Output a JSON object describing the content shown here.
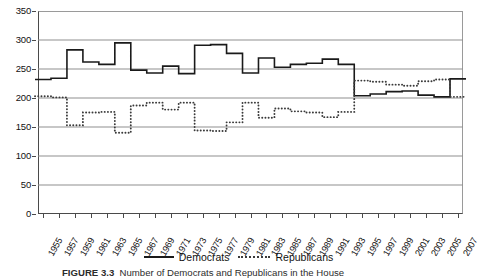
{
  "chart_data": {
    "type": "line",
    "title": "",
    "xlabel": "",
    "ylabel": "",
    "ylim": [
      0,
      350
    ],
    "ytick_step": 50,
    "yticks": [
      0,
      50,
      100,
      150,
      200,
      250,
      300,
      350
    ],
    "grid": "horizontal",
    "legend_position": "bottom-center",
    "x": [
      1955,
      1957,
      1959,
      1961,
      1963,
      1965,
      1967,
      1969,
      1971,
      1973,
      1975,
      1977,
      1979,
      1981,
      1983,
      1985,
      1987,
      1989,
      1991,
      1993,
      1995,
      1997,
      1999,
      2001,
      2003,
      2005,
      2007
    ],
    "categories": [
      "1955",
      "1957",
      "1959",
      "1961",
      "1963",
      "1965",
      "1967",
      "1969",
      "1971",
      "1973",
      "1975",
      "1977",
      "1979",
      "1981",
      "1983",
      "1985",
      "1987",
      "1989",
      "1991",
      "1993",
      "1995",
      "1997",
      "1999",
      "2001",
      "2003",
      "2005",
      "2007"
    ],
    "series": [
      {
        "name": "Democrats",
        "style": "solid",
        "color": "#1a1a1a",
        "values": [
          232,
          234,
          283,
          262,
          258,
          295,
          248,
          243,
          255,
          242,
          291,
          292,
          277,
          243,
          269,
          253,
          258,
          260,
          267,
          258,
          204,
          207,
          211,
          212,
          205,
          202,
          233
        ]
      },
      {
        "name": "Republicans",
        "style": "dotted",
        "color": "#3a3a3a",
        "values": [
          203,
          201,
          153,
          175,
          176,
          140,
          187,
          192,
          180,
          192,
          144,
          143,
          158,
          192,
          166,
          182,
          177,
          175,
          167,
          176,
          230,
          228,
          223,
          221,
          229,
          232,
          202
        ]
      }
    ]
  },
  "legend": {
    "entries": [
      {
        "label": "Democrats",
        "style": "solid"
      },
      {
        "label": "Republicans",
        "style": "dotted"
      }
    ]
  },
  "caption": {
    "figure_number": "FIGURE 3.3",
    "text": "Number of Democrats and Republicans in the House"
  }
}
